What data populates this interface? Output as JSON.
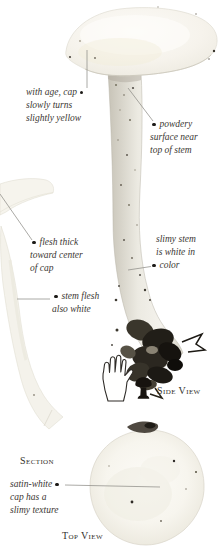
{
  "annotations": {
    "cap_age": {
      "line1": "with age, cap",
      "line2": "slowly turns",
      "line3": "slightly yellow"
    },
    "powdery": {
      "line1": "powdery",
      "line2": "surface near",
      "line3": "top of stem"
    },
    "flesh_thick": {
      "line1": "flesh thick",
      "line2": "toward center",
      "line3": "of cap"
    },
    "stem_flesh": {
      "line1": "stem flesh",
      "line2": "also white"
    },
    "slimy_stem": {
      "line1": "slimy stem",
      "line2": "is white in",
      "line3": "color"
    },
    "satin_white": {
      "line1": "satin-white",
      "line2": "cap has a",
      "line3": "slimy texture"
    }
  },
  "labels": {
    "section": "Section",
    "side_view": "Side View",
    "top_view": "Top View"
  },
  "icons": {
    "hand": "hand-scale-icon",
    "mushroom": "mushroom-scale-icon"
  },
  "colors": {
    "background": "#ffffff",
    "ink": "#3b3733",
    "label_ink": "#33302b",
    "callout_line": "#8f8d88",
    "bullet": "#1c1a17",
    "cap_cream": "#f6f3ec",
    "stem_gray": "#dedbd2",
    "base_dark": "#211e18"
  }
}
